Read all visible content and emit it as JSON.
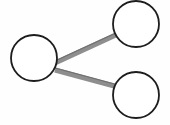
{
  "canvas": {
    "width": 170,
    "height": 125,
    "background_color": "#fefefe"
  },
  "graph": {
    "title": "",
    "node_style": {
      "fill_color": "#ffffff",
      "stroke_color": "#1d1d1d",
      "stroke_width": 1.8,
      "radius": 23
    },
    "edge_style": {
      "stroke_color": "#8e8e8e",
      "highlight_color": "#6f6f6f",
      "stroke_width": 5
    },
    "nodes": [
      {
        "id": "node-left",
        "label": "",
        "cx": 34,
        "cy": 58,
        "r": 23
      },
      {
        "id": "node-top-right",
        "label": "",
        "cx": 136,
        "cy": 24,
        "r": 23
      },
      {
        "id": "node-bottom-right",
        "label": "",
        "cx": 136,
        "cy": 95,
        "r": 23
      }
    ],
    "edges": [
      {
        "id": "edge-left-to-top-right",
        "label": "",
        "source": "node-left",
        "target": "node-top-right",
        "x1": 55,
        "y1": 63,
        "x2": 118,
        "y2": 34
      },
      {
        "id": "edge-left-to-bottom-right",
        "label": "",
        "source": "node-left",
        "target": "node-bottom-right",
        "x1": 55,
        "y1": 70,
        "x2": 118,
        "y2": 87
      }
    ]
  }
}
